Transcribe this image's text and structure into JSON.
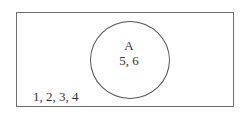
{
  "diagram": {
    "type": "venn",
    "universe": {
      "shape": "rectangle",
      "outside_elements": "1, 2, 3, 4"
    },
    "sets": [
      {
        "label": "A",
        "elements": "5, 6"
      }
    ]
  },
  "colors": {
    "background": "#ffffff",
    "stroke": "#6e6e6e",
    "text": "#333333"
  }
}
